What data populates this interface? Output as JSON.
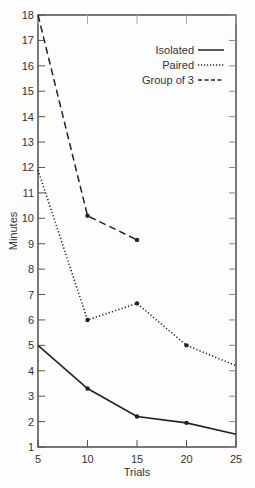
{
  "chart_data": {
    "type": "line",
    "title": "",
    "xlabel": "Trials",
    "ylabel": "Minutes",
    "xlim": [
      5,
      25
    ],
    "ylim": [
      1,
      18
    ],
    "x_ticks": [
      5,
      10,
      15,
      20,
      25
    ],
    "y_ticks": [
      1,
      2,
      3,
      4,
      5,
      6,
      7,
      8,
      9,
      10,
      11,
      12,
      13,
      14,
      15,
      16,
      17,
      18
    ],
    "grid": false,
    "legend_position": "upper right",
    "x": [
      5,
      10,
      15,
      20,
      25
    ],
    "series": [
      {
        "name": "Isolated",
        "style": "solid",
        "x": [
          5,
          10,
          15,
          20,
          25
        ],
        "values": [
          5.0,
          3.3,
          2.2,
          1.95,
          1.5
        ]
      },
      {
        "name": "Paired",
        "style": "dotted",
        "x": [
          5,
          10,
          15,
          20,
          25
        ],
        "values": [
          11.9,
          6.0,
          6.65,
          5.0,
          4.2
        ]
      },
      {
        "name": "Group of 3",
        "style": "dashed",
        "x": [
          5,
          10,
          15
        ],
        "values": [
          18.0,
          10.1,
          9.15
        ]
      }
    ]
  },
  "legend": {
    "isolated": "Isolated",
    "paired": "Paired",
    "group": "Group of 3"
  },
  "axes": {
    "xlabel": "Trials",
    "ylabel": "Minutes"
  }
}
